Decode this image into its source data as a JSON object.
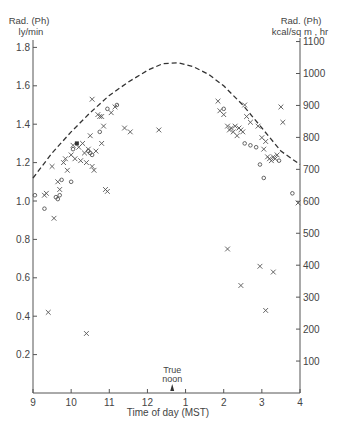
{
  "chart_data": {
    "type": "scatter",
    "title": "",
    "xlabel": "Time of day (MST)",
    "ylabel_left": [
      "Rad. (Ph)",
      "ly/min"
    ],
    "ylabel_right": [
      "Rad. (Ph)",
      "kcal/sq m , hr"
    ],
    "x_ticks": [
      {
        "value": 9,
        "label": "9"
      },
      {
        "value": 10,
        "label": "10"
      },
      {
        "value": 11,
        "label": "11"
      },
      {
        "value": 12,
        "label": "12"
      },
      {
        "value": 13,
        "label": "1"
      },
      {
        "value": 14,
        "label": "2"
      },
      {
        "value": 15,
        "label": "3"
      },
      {
        "value": 16,
        "label": "4"
      }
    ],
    "xlim": [
      9,
      16
    ],
    "ylim_left": [
      0,
      1.9
    ],
    "y_ticks_left": [
      {
        "value": 0.2,
        "label": "0.2"
      },
      {
        "value": 0.4,
        "label": "0.4"
      },
      {
        "value": 0.6,
        "label": "0.6"
      },
      {
        "value": 0.8,
        "label": "0.8"
      },
      {
        "value": 1.0,
        "label": "1.0"
      },
      {
        "value": 1.2,
        "label": "1.2"
      },
      {
        "value": 1.4,
        "label": "1.4"
      },
      {
        "value": 1.6,
        "label": "1.6"
      },
      {
        "value": 1.8,
        "label": "1.8"
      }
    ],
    "y_ticks_right": [
      {
        "value": 100,
        "label": "100"
      },
      {
        "value": 200,
        "label": "200"
      },
      {
        "value": 300,
        "label": "300"
      },
      {
        "value": 400,
        "label": "400"
      },
      {
        "value": 500,
        "label": "500"
      },
      {
        "value": 600,
        "label": "600"
      },
      {
        "value": 700,
        "label": "700"
      },
      {
        "value": 800,
        "label": "800"
      },
      {
        "value": 900,
        "label": "900"
      },
      {
        "value": 1000,
        "label": "1000"
      },
      {
        "value": 1100,
        "label": "1100"
      }
    ],
    "annotation": {
      "text": [
        "True",
        "noon"
      ],
      "x": 12.65
    },
    "grid": false,
    "series": [
      {
        "name": "clear-sky envelope",
        "style": "dashed-line",
        "x": [
          9.0,
          9.5,
          10.0,
          10.5,
          11.0,
          11.5,
          12.0,
          12.4,
          12.8,
          13.2,
          13.6,
          14.0,
          14.5,
          15.0,
          15.5,
          16.0
        ],
        "y": [
          1.12,
          1.25,
          1.36,
          1.46,
          1.55,
          1.62,
          1.68,
          1.715,
          1.72,
          1.7,
          1.66,
          1.6,
          1.5,
          1.38,
          1.26,
          1.19
        ]
      },
      {
        "name": "x observations",
        "marker": "x",
        "x": [
          9.3,
          9.35,
          9.5,
          9.55,
          9.65,
          9.7,
          9.8,
          9.85,
          9.9,
          10.0,
          10.05,
          10.1,
          10.2,
          10.3,
          10.35,
          10.4,
          10.45,
          10.5,
          10.55,
          10.6,
          10.7,
          10.75,
          10.8,
          10.85,
          10.9,
          10.95,
          11.05,
          11.15,
          11.4,
          11.55,
          12.3,
          10.55,
          10.65,
          10.8,
          10.25,
          13.85,
          13.9,
          14.0,
          14.1,
          14.15,
          14.2,
          14.25,
          14.3,
          14.35,
          14.4,
          14.45,
          14.5,
          14.55,
          14.6,
          14.7,
          14.9,
          15.0,
          15.05,
          15.1,
          15.15,
          15.2,
          15.25,
          15.3,
          15.35,
          15.4,
          15.5,
          15.55,
          15.95,
          14.1,
          14.45,
          14.95,
          15.1,
          15.3,
          9.4,
          10.4
        ],
        "y": [
          1.03,
          1.04,
          1.18,
          0.91,
          1.1,
          1.06,
          1.2,
          1.22,
          1.16,
          1.24,
          1.29,
          1.22,
          1.28,
          1.3,
          1.25,
          1.2,
          1.27,
          1.34,
          1.18,
          1.16,
          1.45,
          1.44,
          1.44,
          1.39,
          1.06,
          1.05,
          1.46,
          1.49,
          1.38,
          1.36,
          1.37,
          1.53,
          1.26,
          1.3,
          1.21,
          1.52,
          1.47,
          1.45,
          1.39,
          1.37,
          1.38,
          1.36,
          1.39,
          1.34,
          1.38,
          1.37,
          1.36,
          1.5,
          1.44,
          1.41,
          1.39,
          1.33,
          1.27,
          1.31,
          1.23,
          1.22,
          1.21,
          1.23,
          1.22,
          1.24,
          1.49,
          1.41,
          0.99,
          0.75,
          0.56,
          0.66,
          0.43,
          0.63,
          0.42,
          0.31
        ]
      },
      {
        "name": "o observations",
        "marker": "o",
        "x": [
          9.05,
          9.3,
          9.6,
          9.65,
          9.7,
          9.75,
          10.0,
          10.05,
          10.45,
          10.5,
          10.55,
          10.75,
          10.95,
          11.2,
          14.0,
          14.55,
          14.7,
          14.85,
          14.95,
          15.05,
          15.45,
          15.8
        ],
        "y": [
          1.03,
          0.96,
          1.02,
          1.01,
          1.03,
          1.11,
          1.1,
          1.27,
          1.26,
          1.25,
          1.24,
          1.36,
          1.48,
          1.5,
          1.48,
          1.3,
          1.29,
          1.28,
          1.19,
          1.12,
          1.21,
          1.04
        ]
      },
      {
        "name": "filled observations",
        "marker": "filled-square",
        "x": [
          10.15
        ],
        "y": [
          1.3
        ]
      }
    ]
  }
}
